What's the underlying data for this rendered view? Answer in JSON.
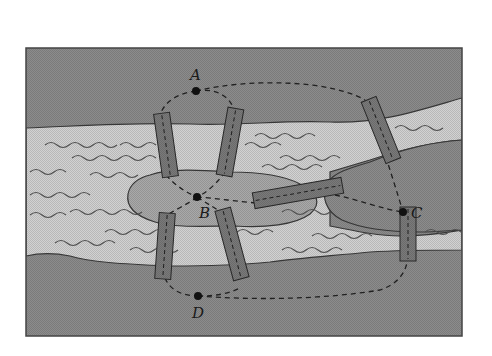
{
  "diagram": {
    "title": "",
    "points": [
      {
        "id": "A",
        "label": "A",
        "x": 196,
        "y": 91
      },
      {
        "id": "B",
        "label": "B",
        "x": 197,
        "y": 197
      },
      {
        "id": "C",
        "label": "C",
        "x": 403,
        "y": 212
      },
      {
        "id": "D",
        "label": "D",
        "x": 198,
        "y": 296
      }
    ],
    "regions": [
      {
        "name": "north-bank",
        "label": "A"
      },
      {
        "name": "central-island",
        "label": "B"
      },
      {
        "name": "east-land",
        "label": "C"
      },
      {
        "name": "south-bank",
        "label": "D"
      }
    ],
    "bridges_count": 7,
    "colors": {
      "land": "#8c8c8c",
      "water": "#d2d2d2",
      "island": "#a9a9a9",
      "bridge": "#7a7a7a",
      "outline": "#3a3a3a",
      "path": "#222222"
    }
  }
}
